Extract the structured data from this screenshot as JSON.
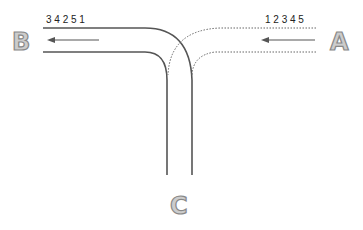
{
  "diagram": {
    "labels": {
      "a": "A",
      "b": "B",
      "c": "C"
    },
    "sequence_in": "1 2 3 4 5",
    "sequence_out": "3 4 2 5 1",
    "colors": {
      "track": "#555555",
      "dotted": "#666666",
      "label_fill": "#cccccc",
      "label_stroke": "#888888"
    }
  }
}
